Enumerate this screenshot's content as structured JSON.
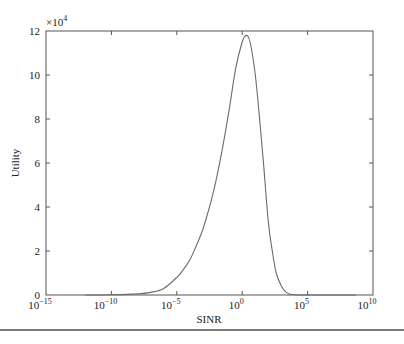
{
  "chart_data": {
    "type": "line",
    "title": "",
    "xlabel": "SINR",
    "ylabel": "Utility",
    "xscale": "log",
    "xlim_log10": [
      -15,
      10
    ],
    "ylim": [
      0,
      12
    ],
    "y_multiplier_label": "×10",
    "y_multiplier_exp": "4",
    "x_ticks": [
      {
        "base": "10",
        "exp": "−15",
        "log10": -15
      },
      {
        "base": "10",
        "exp": "−10",
        "log10": -10
      },
      {
        "base": "10",
        "exp": "−5",
        "log10": -5
      },
      {
        "base": "10",
        "exp": "0",
        "log10": 0
      },
      {
        "base": "10",
        "exp": "5",
        "log10": 5
      },
      {
        "base": "10",
        "exp": "10",
        "log10": 10
      }
    ],
    "y_ticks": [
      "0",
      "2",
      "4",
      "6",
      "8",
      "10",
      "12"
    ],
    "grid": false,
    "legend": null,
    "series": [
      {
        "name": "Utility",
        "color": "#6b6b6b",
        "x_log10": [
          -12,
          -10,
          -8,
          -7,
          -6,
          -5,
          -4.5,
          -4,
          -3.5,
          -3,
          -2.5,
          -2,
          -1.5,
          -1,
          -0.5,
          0,
          0.3,
          0.6,
          1,
          1.3,
          1.6,
          2,
          2.3,
          2.6,
          3,
          3.3,
          3.6,
          4,
          5,
          6,
          7,
          8.7
        ],
        "values": [
          0,
          0.01,
          0.05,
          0.12,
          0.3,
          0.8,
          1.15,
          1.6,
          2.25,
          3.0,
          4.0,
          5.2,
          6.7,
          8.4,
          10.3,
          11.5,
          11.8,
          11.5,
          10.0,
          8.2,
          6.2,
          3.3,
          2.0,
          1.0,
          0.4,
          0.15,
          0.05,
          0.01,
          0,
          0,
          0,
          0
        ]
      }
    ]
  }
}
